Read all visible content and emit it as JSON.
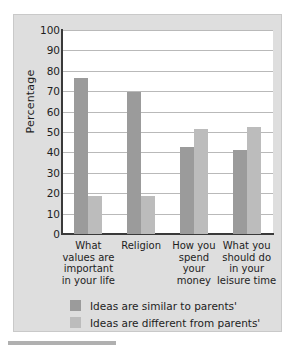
{
  "chart_data": {
    "type": "bar",
    "title": "",
    "xlabel": "",
    "ylabel": "Percentage",
    "ylim": [
      0,
      100
    ],
    "yticks": [
      100,
      90,
      80,
      70,
      60,
      50,
      40,
      30,
      20,
      10,
      0
    ],
    "grid": true,
    "legend_position": "bottom-left",
    "categories": [
      "What values are important in your life",
      "Religion",
      "How you spend your money",
      "What you should do in your leisure time"
    ],
    "category_lines": [
      [
        "What",
        "values are",
        "important",
        "in your life"
      ],
      [
        "Religion"
      ],
      [
        "How you",
        "spend",
        "your",
        "money"
      ],
      [
        "What you",
        "should do",
        "in your",
        "leisure time"
      ]
    ],
    "series": [
      {
        "name": "Ideas are similar to parents'",
        "color": "#9b9b9b",
        "values": [
          76.5,
          69.5,
          42.5,
          41
        ]
      },
      {
        "name": "Ideas are different from parents'",
        "color": "#bcbcbc",
        "values": [
          18.5,
          18.5,
          51.5,
          52.5
        ]
      }
    ]
  },
  "figure": {
    "background_color": "#dedede",
    "plot_background_color": "#ffffff",
    "axis_color": "#3a3a3a",
    "gridline_color": "#b9b9b9"
  },
  "caption": {
    "text": ""
  }
}
